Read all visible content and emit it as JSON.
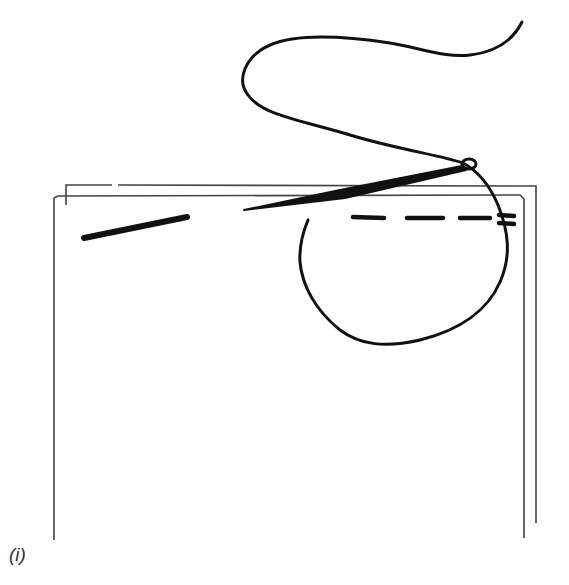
{
  "figure": {
    "caption": "(i)",
    "colors": {
      "ink": "#111111",
      "fabric_edge": "#444444",
      "background": "#ffffff"
    }
  },
  "elements": {
    "back_fabric_layer": "fabric-layer-back",
    "front_fabric_layer": "fabric-layer-front",
    "needle": "needle",
    "thread": "thread",
    "stitch_line": "running-stitch",
    "hidden_needle_segment": "needle-shaft-under-fabric"
  }
}
